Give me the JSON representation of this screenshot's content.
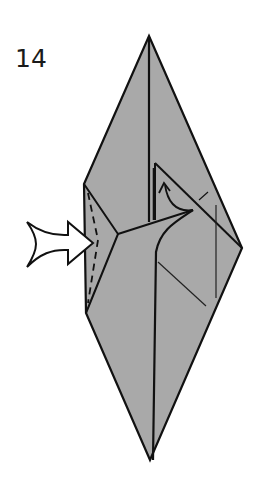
{
  "diagram": {
    "step_number": "14",
    "colors": {
      "paper_fill": "#a9a9a9",
      "line": "#111111",
      "arrow_fill": "#ffffff",
      "background": "#ffffff"
    },
    "elements": [
      {
        "type": "model",
        "shape": "elongated diamond (bird base)",
        "apex_top": [
          149,
          36
        ],
        "apex_bottom": [
          150,
          460
        ],
        "left_edge_x": 84,
        "right_vertex": [
          242,
          248
        ]
      },
      {
        "type": "valley-fold-line",
        "style": "dashed",
        "location": "left flap"
      },
      {
        "type": "push-arrow",
        "style": "hollow",
        "direction": "right",
        "meaning": "inside reverse fold / push in"
      },
      {
        "type": "unfold-arrow",
        "style": "curved with open head",
        "direction": "up",
        "location": "right flap"
      }
    ]
  }
}
